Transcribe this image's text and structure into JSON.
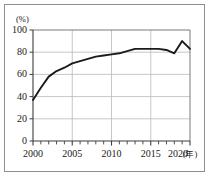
{
  "chart_data": {
    "type": "line",
    "title": "",
    "subtitle": "",
    "xlabel": "(年)",
    "ylabel": "(%)",
    "x": [
      2000,
      2001,
      2002,
      2003,
      2004,
      2005,
      2006,
      2007,
      2008,
      2009,
      2010,
      2011,
      2012,
      2013,
      2014,
      2015,
      2016,
      2017,
      2018,
      2019,
      2020
    ],
    "values": [
      37,
      48,
      58,
      63,
      66,
      70,
      72,
      74,
      76,
      77,
      78,
      79,
      81,
      83,
      83,
      83,
      83,
      82,
      79,
      90,
      83
    ],
    "series": [
      {
        "name": "普及率",
        "values": [
          37,
          48,
          58,
          63,
          66,
          70,
          72,
          74,
          76,
          77,
          78,
          79,
          81,
          83,
          83,
          83,
          83,
          82,
          79,
          90,
          83
        ]
      }
    ],
    "xlim": [
      2000,
      2020
    ],
    "ylim": [
      0,
      100
    ],
    "xticks": [
      2000,
      2005,
      2010,
      2015,
      2020
    ],
    "xtick_labels": [
      "2000",
      "2005",
      "2010",
      "2015",
      "2020"
    ],
    "x_minor_tick_step": 1,
    "yticks": [
      0,
      20,
      40,
      60,
      80,
      100
    ],
    "ytick_labels": [
      "0",
      "20",
      "40",
      "60",
      "80",
      "100"
    ],
    "grid": true,
    "grid_axis": "both",
    "legend": false,
    "legend_position": "none",
    "line_color": "#1a1a1a",
    "grid_color": "#b4b4b4",
    "axis_color": "#4d4d4d",
    "frame_color": "#8e8e8e",
    "background_color": "#ffffff"
  },
  "axis": {
    "y_unit_label": "(%)",
    "x_unit_label": "(年)"
  }
}
